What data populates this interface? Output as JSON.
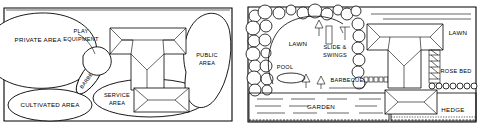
{
  "figure": {
    "type": "landscape-plan-diagram-pair",
    "panel_count": 2
  },
  "left_plan": {
    "title_hidden": "",
    "zones": [
      {
        "id": "private-area",
        "label": "PRIVATE AREA",
        "shape": "ellipse"
      },
      {
        "id": "play-equipment",
        "label_line1": "PLAY",
        "label_line2": "EQUIPMENT",
        "shape": "callout"
      },
      {
        "id": "barbecue",
        "label": "BARBECUE",
        "shape": "ellipse-rotated",
        "rotation_deg": -55
      },
      {
        "id": "cultivated-area",
        "label": "CULTIVATED AREA",
        "shape": "ellipse"
      },
      {
        "id": "service-area",
        "label_line1": "SERVICE",
        "label_line2": "AREA",
        "shape": "ellipse"
      },
      {
        "id": "public-area",
        "label_line1": "PUBLIC",
        "label_line2": "AREA",
        "shape": "blob"
      }
    ],
    "structures": [
      {
        "id": "house",
        "shape": "t-shaped-hip-roof"
      },
      {
        "id": "garage",
        "shape": "rectangle-hip-roof"
      }
    ]
  },
  "right_plan": {
    "zones": [
      {
        "id": "lawn-rear",
        "label": "LAWN"
      },
      {
        "id": "lawn-front",
        "label": "LAWN"
      },
      {
        "id": "pool",
        "label": "POOL"
      },
      {
        "id": "slide-swings",
        "label_line1": "SLIDE &",
        "label_line2": "SWINGS"
      },
      {
        "id": "barbecue",
        "label": "BARBECUE"
      },
      {
        "id": "garden",
        "label": "GARDEN"
      },
      {
        "id": "berries",
        "label": "BERRIES"
      },
      {
        "id": "rose-bed",
        "label": "ROSE BED"
      },
      {
        "id": "hedge",
        "label": "HEDGE"
      }
    ],
    "structures": [
      {
        "id": "house",
        "shape": "t-shaped-hip-roof"
      },
      {
        "id": "garage",
        "shape": "rectangle-hip-roof"
      }
    ]
  },
  "colors": {
    "ink": "#000000",
    "paper": "#ffffff"
  }
}
